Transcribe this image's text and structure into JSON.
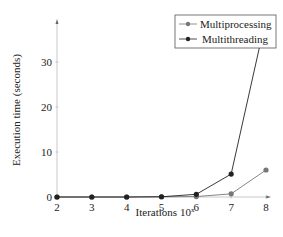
{
  "chart_data": {
    "type": "line",
    "title": "",
    "xlabel": "Iterations 10^x",
    "ylabel": "Execution time (seconds)",
    "x": [
      2,
      3,
      4,
      5,
      6,
      7,
      8
    ],
    "xticks": [
      "2",
      "3",
      "4",
      "5",
      "6",
      "7",
      "8"
    ],
    "yticks": [
      "0",
      "10",
      "20",
      "30"
    ],
    "xlim": [
      2,
      8
    ],
    "ylim": [
      0,
      40
    ],
    "grid": false,
    "legend_position": "upper right",
    "series": [
      {
        "name": "Multiprocessing",
        "color": "#777777",
        "values": [
          0,
          0,
          0,
          0.05,
          0.1,
          0.7,
          6.0
        ]
      },
      {
        "name": "Multithreading",
        "color": "#222222",
        "values": [
          0,
          0,
          0,
          0.05,
          0.6,
          5.1,
          39.8
        ]
      }
    ]
  },
  "labels": {
    "xlabel": "Iterations 10",
    "xlabel_sup": "x",
    "ylabel": "Execution time (seconds)",
    "legend": [
      "Multiprocessing",
      "Multithreading"
    ]
  }
}
